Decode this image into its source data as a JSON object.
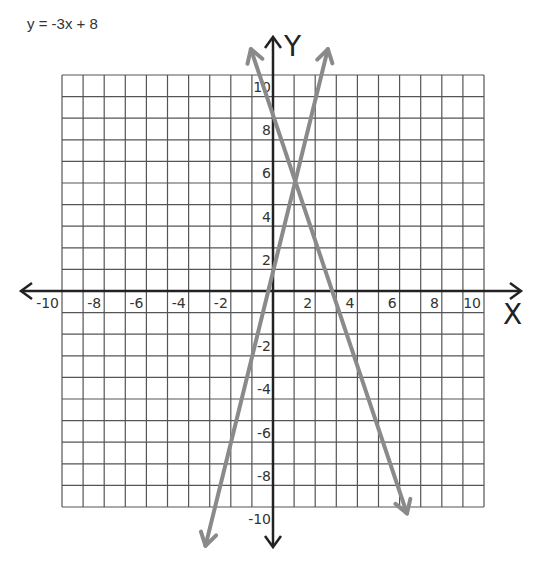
{
  "title": "y = -3x + 8",
  "chart_data": {
    "type": "line",
    "title": "y = -3x + 8",
    "xlabel": "X",
    "ylabel": "Y",
    "xlim": [
      -10,
      10
    ],
    "ylim": [
      -10,
      10
    ],
    "grid": true,
    "grid_step": 1,
    "x_tick_labels": [
      "-10",
      "-8",
      "-6",
      "-4",
      "-2",
      "2",
      "4",
      "6",
      "8",
      "10"
    ],
    "x_tick_values": [
      -10,
      -8,
      -6,
      -4,
      -2,
      2,
      4,
      6,
      8,
      10
    ],
    "y_tick_labels": [
      "10",
      "8",
      "6",
      "4",
      "2",
      "-2",
      "-4",
      "-6",
      "-8",
      "-10"
    ],
    "y_tick_values": [
      10,
      8,
      6,
      4,
      2,
      -2,
      -4,
      -6,
      -8,
      -10
    ],
    "series": [
      {
        "name": "y = -3x + 8",
        "slope": -3,
        "intercept": 8,
        "from": [
          -1.05,
          11.2
        ],
        "to": [
          6.35,
          -10.3
        ]
      },
      {
        "name": "y = 4x + 1",
        "slope": 4,
        "intercept": 1,
        "from": [
          -3.2,
          -11.8
        ],
        "to": [
          2.6,
          11.2
        ]
      }
    ],
    "intersection": [
      1,
      5
    ],
    "colors": {
      "grid": "#555555",
      "axes": "#222222",
      "lines": "#8a8a8a"
    }
  }
}
